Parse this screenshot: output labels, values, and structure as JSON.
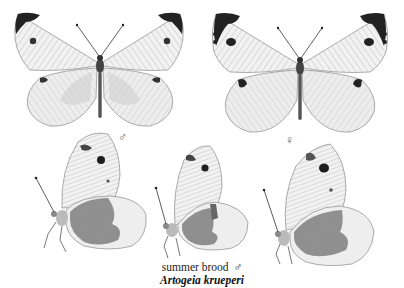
{
  "plate": {
    "species": "Artogeia krueperi",
    "brood_label": "summer brood",
    "brood_symbol": "♂",
    "male_symbol": "♂",
    "female_symbol": "♀",
    "colors": {
      "background": "#ffffff",
      "wing_fill": "#f1f1f1",
      "wing_shade": "#c8c8c8",
      "vein": "#8a8a8a",
      "markings": "#1e1e1e",
      "hindwing_under": "#8f8f8f"
    }
  },
  "specimens": [
    {
      "view": "upperside",
      "sex": "male",
      "position": "top-left"
    },
    {
      "view": "upperside",
      "sex": "female",
      "position": "top-right"
    },
    {
      "view": "underside",
      "sex": "male",
      "position": "bottom-left"
    },
    {
      "view": "underside",
      "sex": "male",
      "position": "bottom-center"
    },
    {
      "view": "underside",
      "sex": "female",
      "position": "bottom-right"
    }
  ]
}
